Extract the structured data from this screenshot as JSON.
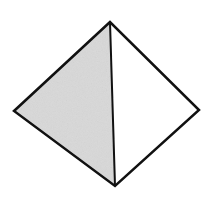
{
  "diagram": {
    "type": "pyramid-wireframe",
    "vertices": {
      "top": [
        110,
        22
      ],
      "left": [
        14,
        111
      ],
      "right": [
        199,
        110
      ],
      "bottom": [
        115,
        186
      ]
    },
    "faces": [
      {
        "name": "left-face",
        "points": [
          "top",
          "left",
          "bottom"
        ],
        "fill": "#d9d9d9"
      },
      {
        "name": "right-face",
        "points": [
          "top",
          "right",
          "bottom"
        ],
        "fill": "#ffffff"
      }
    ],
    "edges": [
      {
        "from": "top",
        "to": "left"
      },
      {
        "from": "left",
        "to": "bottom"
      },
      {
        "from": "bottom",
        "to": "right"
      },
      {
        "from": "right",
        "to": "top"
      },
      {
        "from": "top",
        "to": "bottom"
      }
    ],
    "stroke_color": "#111111",
    "stroke_width": 2.5,
    "background": "#ffffff"
  }
}
